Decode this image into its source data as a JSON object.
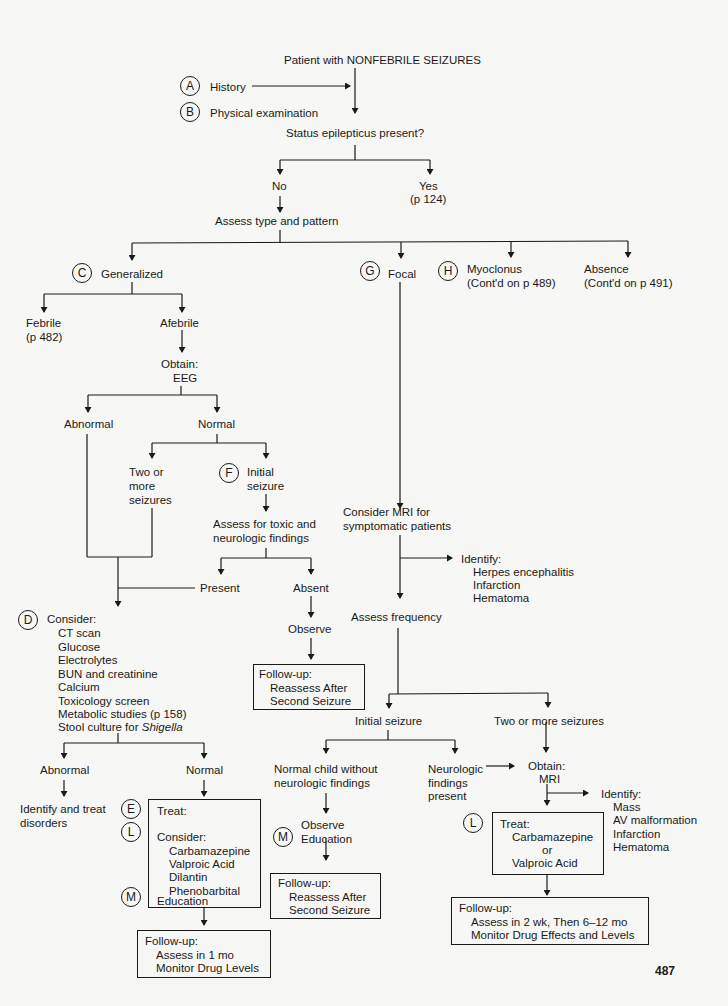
{
  "title": "Patient with NONFEBRILE SEIZURES",
  "markers": {
    "A": "A",
    "B": "B",
    "C": "C",
    "D": "D",
    "E": "E",
    "F": "F",
    "G": "G",
    "H": "H",
    "L": "L",
    "M": "M"
  },
  "intro": {
    "history": "History",
    "physical": "Physical examination"
  },
  "status": {
    "question": "Status epilepticus present?",
    "no": "No",
    "yes": "Yes",
    "yes_ref": "(p 124)"
  },
  "assess_type": "Assess type and pattern",
  "types": {
    "generalized": "Generalized",
    "focal": "Focal",
    "myoclonus": "Myoclonus",
    "myoclonus_ref": "(Cont'd on p 489)",
    "absence": "Absence",
    "absence_ref": "(Cont'd on p 491)"
  },
  "generalized": {
    "febrile": "Febrile",
    "febrile_ref": "(p 482)",
    "afebrile": "Afebrile",
    "obtain": "Obtain:",
    "eeg": "EEG",
    "abnormal": "Abnormal",
    "normal": "Normal",
    "two_or_more": [
      "Two or",
      "more",
      "seizures"
    ],
    "initial": [
      "Initial",
      "seizure"
    ],
    "assess_toxic": [
      "Assess for toxic and",
      "neurologic findings"
    ],
    "present": "Present",
    "absent": "Absent",
    "observe": "Observe",
    "followup1": {
      "head": "Follow-up:",
      "lines": [
        "Reassess After",
        "Second Seizure"
      ]
    },
    "consider": {
      "head": "Consider:",
      "items": [
        "CT scan",
        "Glucose",
        "Electrolytes",
        "BUN and creatinine",
        "Calcium",
        "Toxicology screen",
        "Metabolic studies (p 158)"
      ],
      "last_prefix": "Stool culture for ",
      "last_italic": "Shigella"
    },
    "abnormal2": "Abnormal",
    "normal2": "Normal",
    "identify_treat": [
      "Identify and treat",
      "disorders"
    ],
    "treat_box": {
      "treat": "Treat:",
      "consider": "Consider:",
      "drugs": [
        "Carbamazepine",
        "Valproic Acid",
        "Dilantin",
        "Phenobarbital"
      ],
      "education": "Education"
    },
    "followup2": {
      "head": "Follow-up:",
      "lines": [
        "Assess in 1 mo",
        "Monitor Drug Levels"
      ]
    }
  },
  "focal": {
    "consider_mri": [
      "Consider MRI for",
      "symptomatic patients"
    ],
    "identify1": {
      "head": "Identify:",
      "items": [
        "Herpes encephalitis",
        "Infarction",
        "Hematoma"
      ]
    },
    "assess_freq": "Assess frequency",
    "initial": "Initial seizure",
    "two_or_more": "Two or more seizures",
    "normal_child": [
      "Normal child without",
      "neurologic findings"
    ],
    "neuro_present": [
      "Neurologic",
      "findings",
      "present"
    ],
    "observe": "Observe",
    "education": "Education",
    "followup3": {
      "head": "Follow-up:",
      "lines": [
        "Reassess After",
        "Second Seizure"
      ]
    },
    "obtain": "Obtain:",
    "mri": "MRI",
    "identify2": {
      "head": "Identify:",
      "items": [
        "Mass",
        "AV malformation",
        "Infarction",
        "Hematoma"
      ]
    },
    "treat_box": {
      "treat": "Treat:",
      "lines": [
        "Carbamazepine",
        "or",
        "Valproic Acid"
      ]
    },
    "followup4": {
      "head": "Follow-up:",
      "lines": [
        "Assess in 2 wk, Then 6–12 mo",
        "Monitor Drug Effects and Levels"
      ]
    }
  },
  "page_number": "487"
}
